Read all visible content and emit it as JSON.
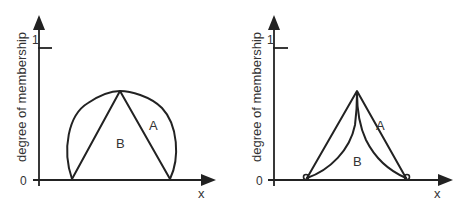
{
  "diagrams": [
    {
      "id": "left",
      "y_axis_label": "degree of membership",
      "x_axis_label": "x",
      "y_tick_top": "1",
      "y_tick_bottom": "0",
      "region_outer_label": "A",
      "region_inner_label": "B",
      "description": "Triangular membership function B inscribed in a convex arc-shaped membership function A"
    },
    {
      "id": "right",
      "y_axis_label": "degree of membership",
      "x_axis_label": "x",
      "y_tick_top": "1",
      "y_tick_bottom": "0",
      "region_outer_label": "A",
      "region_inner_label": "B",
      "description": "Triangular membership function A containing a concave-sided membership function B"
    }
  ],
  "colors": {
    "stroke": "#222222",
    "text": "#333333",
    "background": "#ffffff"
  }
}
